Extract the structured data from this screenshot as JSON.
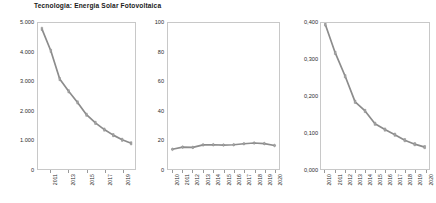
{
  "figure": {
    "title": "Tecnologia: Energia Solar Fotovoltaica",
    "background_color": "#ffffff",
    "line_color": "#8c8c8c",
    "frame_color": "#c8c8c8",
    "text_color": "#2b2b2b"
  },
  "chart_data": [
    {
      "type": "line",
      "title": "",
      "xlabel": "",
      "ylabel": "",
      "grid": false,
      "legend": "none",
      "x": [
        "2010",
        "2011",
        "2012",
        "2013",
        "2014",
        "2015",
        "2016",
        "2017",
        "2018",
        "2019",
        "2020"
      ],
      "tick_labels_x": [
        "2011",
        "2013",
        "2015",
        "2017",
        "2019"
      ],
      "tick_labels_y": [
        "0",
        "1.000",
        "2.000",
        "3.000",
        "4.000",
        "5.000"
      ],
      "ylim": [
        0,
        5000
      ],
      "xlim": [
        2010,
        2020
      ],
      "values": [
        4800,
        4050,
        3080,
        2660,
        2280,
        1860,
        1580,
        1350,
        1160,
        1000,
        880
      ],
      "marker": "square"
    },
    {
      "type": "line",
      "title": "",
      "xlabel": "",
      "ylabel": "",
      "grid": false,
      "legend": "none",
      "x": [
        "2010",
        "2011",
        "2012",
        "2013",
        "2014",
        "2015",
        "2016",
        "2017",
        "2018",
        "2019",
        "2020"
      ],
      "tick_labels_x": [
        "2010",
        "2011",
        "2012",
        "2013",
        "2014",
        "2015",
        "2016",
        "2017",
        "2018",
        "2019",
        "2020"
      ],
      "tick_labels_y": [
        "0",
        "20",
        "40",
        "60",
        "80",
        "100"
      ],
      "ylim": [
        0,
        100
      ],
      "xlim": [
        2010,
        2020
      ],
      "values": [
        13.5,
        15.0,
        14.8,
        16.5,
        16.6,
        16.4,
        16.6,
        17.3,
        17.8,
        17.4,
        16.1
      ],
      "marker": "circle"
    },
    {
      "type": "line",
      "title": "",
      "xlabel": "",
      "ylabel": "",
      "grid": false,
      "legend": "none",
      "x": [
        "2010",
        "2011",
        "2012",
        "2013",
        "2014",
        "2015",
        "2016",
        "2017",
        "2018",
        "2019",
        "2020"
      ],
      "tick_labels_x": [
        "2010",
        "2011",
        "2012",
        "2013",
        "2014",
        "2015",
        "2016",
        "2017",
        "2018",
        "2019",
        "2020"
      ],
      "tick_labels_y": [
        "0,000",
        "0,100",
        "0,200",
        "0,300",
        "0,400"
      ],
      "ylim": [
        0,
        0.4
      ],
      "xlim": [
        2010,
        2020
      ],
      "values": [
        0.396,
        0.318,
        0.254,
        0.184,
        0.159,
        0.124,
        0.108,
        0.094,
        0.079,
        0.068,
        0.06
      ],
      "marker": "square"
    }
  ]
}
